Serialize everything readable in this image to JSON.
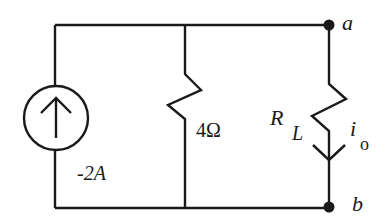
{
  "diagram": {
    "type": "circuit",
    "components": {
      "current_source": {
        "label": "-2A",
        "direction": "up"
      },
      "shunt_resistor": {
        "label": "4Ω"
      },
      "load_resistor": {
        "label_main": "R",
        "label_sub": "L"
      },
      "load_current": {
        "label_main": "i",
        "label_sub": "o",
        "direction": "down"
      }
    },
    "terminals": {
      "top": "a",
      "bottom": "b"
    },
    "colors": {
      "wire": "#1a1a1a",
      "background": "#ffffff"
    }
  }
}
